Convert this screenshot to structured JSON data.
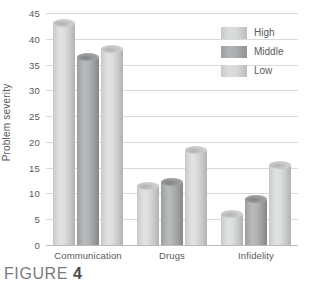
{
  "figure": {
    "caption_prefix": "FIGURE",
    "caption_number": "4"
  },
  "colors": {
    "series_light": "#d5d6d7",
    "series_dark": "#a8a9aa",
    "gridline": "#d9dadb",
    "text": "#58595b",
    "background": "#ffffff"
  },
  "legend": {
    "position": "top-right",
    "entries": [
      {
        "label": "High",
        "swatch": "series_light"
      },
      {
        "label": "Middle",
        "swatch": "series_dark"
      },
      {
        "label": "Low",
        "swatch": "series_light"
      }
    ]
  },
  "axes": {
    "y_title": "Problem severity",
    "y_ticks": [
      "0",
      "5",
      "10",
      "15",
      "20",
      "25",
      "30",
      "35",
      "40",
      "45"
    ],
    "x_labels": [
      "Communication",
      "Drugs",
      "Infidelity"
    ]
  },
  "chart_data": {
    "type": "bar",
    "title": "",
    "subtitle": "",
    "xlabel": "",
    "ylabel": "Problem severity",
    "categories": [
      "Communication",
      "Drugs",
      "Infidelity"
    ],
    "series": [
      {
        "name": "High",
        "values": [
          43,
          11.5,
          6
        ]
      },
      {
        "name": "Middle",
        "values": [
          36.5,
          12.3,
          9
        ]
      },
      {
        "name": "Low",
        "values": [
          38,
          18.5,
          15.5
        ]
      }
    ],
    "ylim": [
      0,
      45
    ],
    "ytick_step": 5,
    "grid": true,
    "legend_position": "top-right",
    "bar_style": "cylinder"
  }
}
